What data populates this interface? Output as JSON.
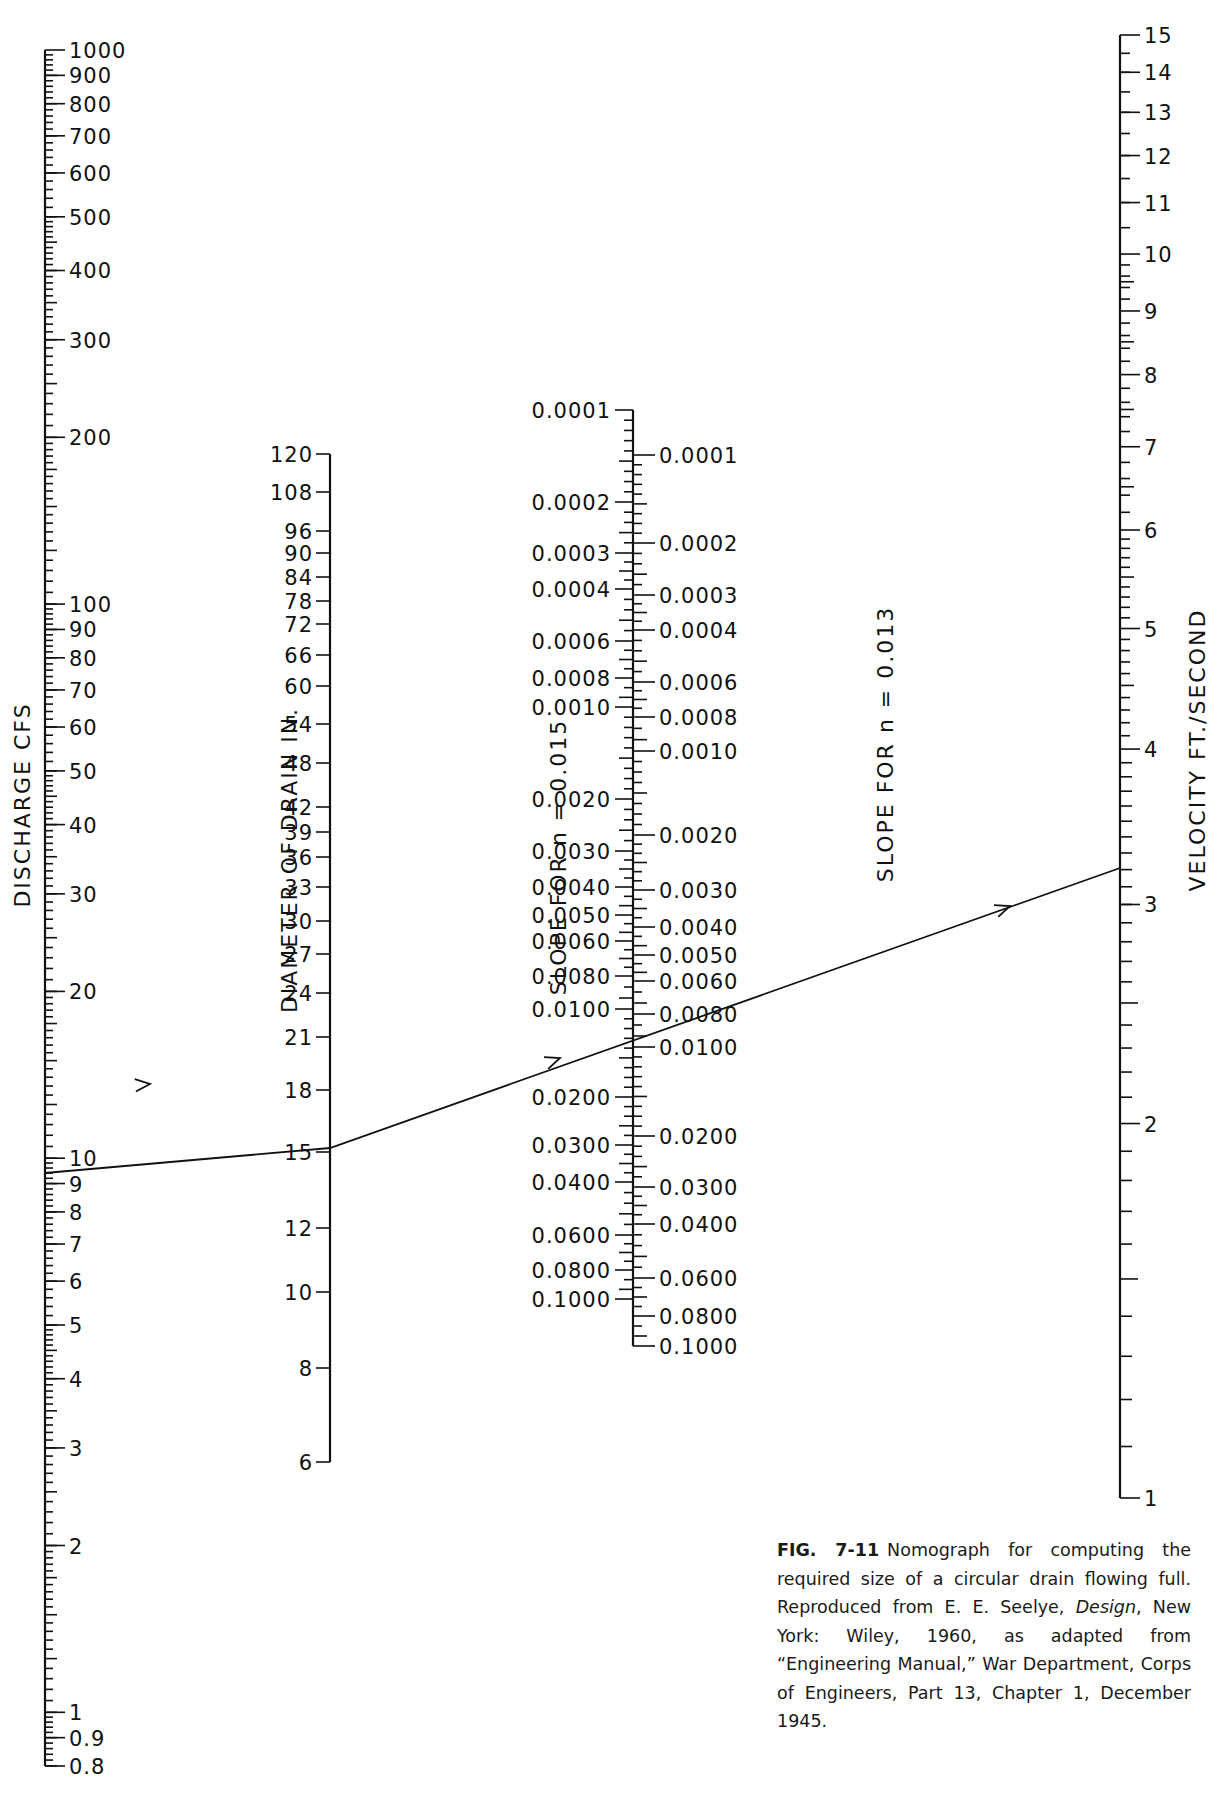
{
  "chart_data": {
    "type": "nomograph",
    "title": "Nomograph for computing the required size of a circular drain flowing full",
    "scales": [
      {
        "id": "discharge",
        "label": "DISCHARGE CFS",
        "x": 45,
        "y_top": 50,
        "y_bottom": 1766,
        "tick_side": "right",
        "log_min": 0.8,
        "log_max": 1000,
        "scale": "log",
        "labels": [
          {
            "t": "1000",
            "v": 1000
          },
          {
            "t": "900",
            "v": 900
          },
          {
            "t": "800",
            "v": 800
          },
          {
            "t": "700",
            "v": 700
          },
          {
            "t": "600",
            "v": 600
          },
          {
            "t": "500",
            "v": 500
          },
          {
            "t": "400",
            "v": 400
          },
          {
            "t": "300",
            "v": 300
          },
          {
            "t": "200",
            "v": 200
          },
          {
            "t": "100",
            "v": 100
          },
          {
            "t": "90",
            "v": 90
          },
          {
            "t": "80",
            "v": 80
          },
          {
            "t": "70",
            "v": 70
          },
          {
            "t": "60",
            "v": 60
          },
          {
            "t": "50",
            "v": 50
          },
          {
            "t": "40",
            "v": 40
          },
          {
            "t": "30",
            "v": 30
          },
          {
            "t": "20",
            "v": 20
          },
          {
            "t": "10",
            "v": 10
          },
          {
            "t": "9",
            "v": 9
          },
          {
            "t": "8",
            "v": 8
          },
          {
            "t": "7",
            "v": 7
          },
          {
            "t": "6",
            "v": 6
          },
          {
            "t": "5",
            "v": 5
          },
          {
            "t": "4",
            "v": 4
          },
          {
            "t": "3",
            "v": 3
          },
          {
            "t": "2",
            "v": 2
          },
          {
            "t": "1",
            "v": 1
          },
          {
            "t": "0.9",
            "v": 0.9
          },
          {
            "t": "0.8",
            "v": 0.8
          }
        ]
      },
      {
        "id": "diameter",
        "label": "DIAMETER OF DRAIN IN.",
        "x": 330,
        "tick_side": "left",
        "labels": [
          {
            "t": "120",
            "y": 454
          },
          {
            "t": "108",
            "y": 492
          },
          {
            "t": "96",
            "y": 531
          },
          {
            "t": "90",
            "y": 553
          },
          {
            "t": "84",
            "y": 577
          },
          {
            "t": "78",
            "y": 601
          },
          {
            "t": "72",
            "y": 624
          },
          {
            "t": "66",
            "y": 655
          },
          {
            "t": "60",
            "y": 686
          },
          {
            "t": "54",
            "y": 724
          },
          {
            "t": "48",
            "y": 763
          },
          {
            "t": "42",
            "y": 807
          },
          {
            "t": "39",
            "y": 832
          },
          {
            "t": "36",
            "y": 857
          },
          {
            "t": "33",
            "y": 887
          },
          {
            "t": "30",
            "y": 921
          },
          {
            "t": "27",
            "y": 954
          },
          {
            "t": "24",
            "y": 993
          },
          {
            "t": "21",
            "y": 1037
          },
          {
            "t": "18",
            "y": 1090
          },
          {
            "t": "15",
            "y": 1152
          },
          {
            "t": "12",
            "y": 1228
          },
          {
            "t": "10",
            "y": 1292
          },
          {
            "t": "8",
            "y": 1368
          },
          {
            "t": "6",
            "y": 1462
          }
        ]
      },
      {
        "id": "slope_n015",
        "label": "SLOPE FOR n = 0.015",
        "x": 633,
        "tick_side": "left",
        "labels": [
          {
            "t": "0.0001",
            "y": 410
          },
          {
            "t": "0.0002",
            "y": 502
          },
          {
            "t": "0.0003",
            "y": 553
          },
          {
            "t": "0.0004",
            "y": 589
          },
          {
            "t": "0.0006",
            "y": 641
          },
          {
            "t": "0.0008",
            "y": 678
          },
          {
            "t": "0.0010",
            "y": 707
          },
          {
            "t": "0.0020",
            "y": 799
          },
          {
            "t": "0.0030",
            "y": 851
          },
          {
            "t": "0.0040",
            "y": 887
          },
          {
            "t": "0.0050",
            "y": 915
          },
          {
            "t": "0.0060",
            "y": 941
          },
          {
            "t": "0.0080",
            "y": 976
          },
          {
            "t": "0.0100",
            "y": 1009
          },
          {
            "t": "0.0200",
            "y": 1097
          },
          {
            "t": "0.0300",
            "y": 1145
          },
          {
            "t": "0.0400",
            "y": 1182
          },
          {
            "t": "0.0600",
            "y": 1235
          },
          {
            "t": "0.0800",
            "y": 1270
          },
          {
            "t": "0.1000",
            "y": 1299
          }
        ]
      },
      {
        "id": "slope_n013",
        "label": "SLOPE FOR n = 0.013",
        "x": 633,
        "tick_side": "right",
        "labels": [
          {
            "t": "0.0001",
            "y": 455
          },
          {
            "t": "0.0002",
            "y": 543
          },
          {
            "t": "0.0003",
            "y": 595
          },
          {
            "t": "0.0004",
            "y": 630
          },
          {
            "t": "0.0006",
            "y": 682
          },
          {
            "t": "0.0008",
            "y": 717
          },
          {
            "t": "0.0010",
            "y": 751
          },
          {
            "t": "0.0020",
            "y": 835
          },
          {
            "t": "0.0030",
            "y": 890
          },
          {
            "t": "0.0040",
            "y": 927
          },
          {
            "t": "0.0050",
            "y": 955
          },
          {
            "t": "0.0060",
            "y": 981
          },
          {
            "t": "0.0080",
            "y": 1014
          },
          {
            "t": "0.0100",
            "y": 1047
          },
          {
            "t": "0.0200",
            "y": 1136
          },
          {
            "t": "0.0300",
            "y": 1187
          },
          {
            "t": "0.0400",
            "y": 1224
          },
          {
            "t": "0.0600",
            "y": 1278
          },
          {
            "t": "0.0800",
            "y": 1316
          },
          {
            "t": "0.1000",
            "y": 1346
          }
        ]
      },
      {
        "id": "velocity",
        "label": "VELOCITY FT./SECOND",
        "x": 1120,
        "y_top": 35,
        "y_bottom": 1498,
        "tick_side": "right",
        "log_min": 1,
        "log_max": 15,
        "scale": "log",
        "labels": [
          {
            "t": "1",
            "v": 1
          },
          {
            "t": "2",
            "v": 2
          },
          {
            "t": "3",
            "v": 3
          },
          {
            "t": "4",
            "v": 4
          },
          {
            "t": "5",
            "v": 5
          },
          {
            "t": "6",
            "v": 6
          },
          {
            "t": "7",
            "v": 7
          },
          {
            "t": "8",
            "v": 8
          },
          {
            "t": "9",
            "v": 9
          },
          {
            "t": "10",
            "v": 10
          },
          {
            "t": "11",
            "v": 11
          },
          {
            "t": "12",
            "v": 12
          },
          {
            "t": "13",
            "v": 13
          },
          {
            "t": "14",
            "v": 14
          },
          {
            "t": "15",
            "v": 15
          }
        ]
      }
    ],
    "example_solution": {
      "discharge_cfs": 6.1,
      "diameter_in": 15,
      "slope_n015": 0.0105,
      "slope_n013": 0.0055,
      "velocity_ft_s": 4.6,
      "path": [
        [
          45,
          1173
        ],
        [
          330,
          1148
        ],
        [
          1120,
          868
        ]
      ],
      "arrows_at": [
        [
          150,
          1084
        ],
        [
          560,
          1058
        ],
        [
          1010,
          906
        ]
      ]
    }
  },
  "caption": {
    "fig_label": "FIG. 7-11",
    "text_before_title": "Nomograph for computing the required size of a circular drain flowing full. Reproduced from E. E. Seelye, ",
    "book_title": "Design",
    "text_after_title": ", New York: Wiley, 1960, as adapted from “Engineering Manual,” War Department, Corps of Engineers, Part 13, Chapter 1, December 1945."
  }
}
